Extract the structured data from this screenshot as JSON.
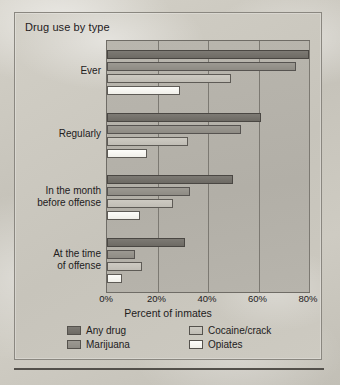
{
  "chart_data": {
    "type": "bar",
    "orientation": "horizontal",
    "title": "Drug use by type",
    "xlabel": "Percent of inmates",
    "ylabel": "",
    "xlim": [
      0,
      80
    ],
    "xticks": [
      "0%",
      "20%",
      "40%",
      "60%",
      "80%"
    ],
    "xtick_values": [
      0,
      20,
      40,
      60,
      80
    ],
    "grid": true,
    "legend_position": "bottom",
    "categories": [
      "Ever",
      "Regularly",
      "In the month\nbefore offense",
      "At the time\nof offense"
    ],
    "category_labels": [
      {
        "line1": "Ever",
        "line2": ""
      },
      {
        "line1": "Regularly",
        "line2": ""
      },
      {
        "line1": "In the month",
        "line2": "before offense"
      },
      {
        "line1": "At the time",
        "line2": "of offense"
      }
    ],
    "series": [
      {
        "name": "Any drug",
        "key": "any",
        "color": "#6d6a64",
        "values": [
          80,
          61,
          50,
          31
        ]
      },
      {
        "name": "Marijuana",
        "key": "mar",
        "color": "#8e8b84",
        "values": [
          75,
          53,
          33,
          11
        ]
      },
      {
        "name": "Cocaine/crack",
        "key": "coc",
        "color": "#c0bdb5",
        "values": [
          49,
          32,
          26,
          14
        ]
      },
      {
        "name": "Opiates",
        "key": "opi",
        "color": "#f0efe9",
        "values": [
          29,
          16,
          13,
          6
        ]
      }
    ]
  },
  "legend": {
    "items": [
      {
        "label": "Any drug",
        "key": "any"
      },
      {
        "label": "Cocaine/crack",
        "key": "coc"
      },
      {
        "label": "Marijuana",
        "key": "mar"
      },
      {
        "label": "Opiates",
        "key": "opi"
      }
    ]
  }
}
